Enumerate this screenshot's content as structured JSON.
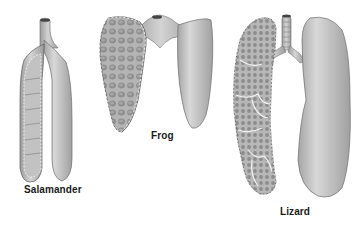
{
  "figure": {
    "panels": [
      {
        "id": "salamander",
        "label": "Salamander"
      },
      {
        "id": "frog",
        "label": "Frog"
      },
      {
        "id": "lizard",
        "label": "Lizard"
      }
    ]
  },
  "colors": {
    "background": "#ffffff",
    "lung_fill": "#bdbdbd",
    "lung_light": "#d6d6d6",
    "lung_dark": "#8a8a8a",
    "outline": "#5a5a5a",
    "alveoli": "#9a9a9a",
    "label_text": "#1a1a1a"
  }
}
